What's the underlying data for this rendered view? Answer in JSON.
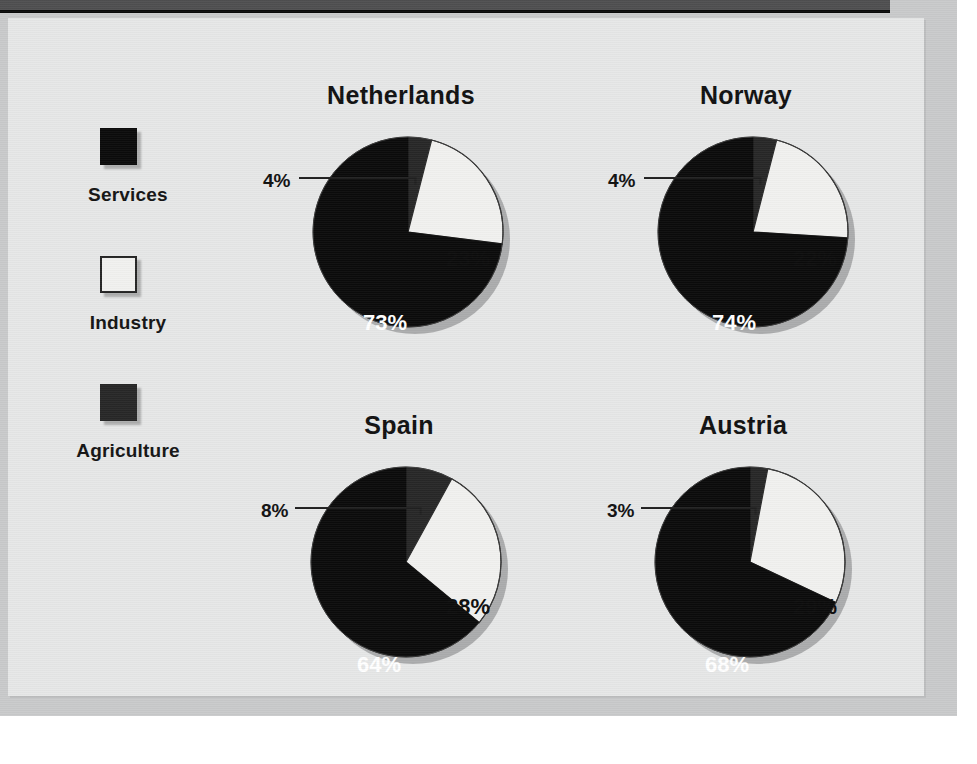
{
  "titlebar": {
    "text": ""
  },
  "legend": {
    "items": [
      {
        "label": "Services",
        "color": "#0b0b0b",
        "swatch": "filled-black-square"
      },
      {
        "label": "Industry",
        "color": "#f1f1ef",
        "swatch": "outlined-white-square"
      },
      {
        "label": "Agriculture",
        "color": "#272727",
        "swatch": "filled-darkgray-square"
      }
    ]
  },
  "colors": {
    "services": "#0b0b0b",
    "industry": "#f1f1ef",
    "agriculture": "#272727",
    "panel_background": "#e6e7e7",
    "frame": "#c9cacb",
    "titlebar": "#4f4f50"
  },
  "chart_data": [
    {
      "type": "pie",
      "title": "Netherlands",
      "labels": [
        "Agriculture",
        "Industry",
        "Services"
      ],
      "values": [
        4,
        23,
        73
      ],
      "value_labels": [
        "4%",
        "23%",
        "73%"
      ],
      "colors": [
        "#272727",
        "#f1f1ef",
        "#0b0b0b"
      ],
      "leader_label": "4%",
      "legend_position": "left",
      "grid": false
    },
    {
      "type": "pie",
      "title": "Norway",
      "labels": [
        "Agriculture",
        "Industry",
        "Services"
      ],
      "values": [
        4,
        22,
        74
      ],
      "value_labels": [
        "4%",
        "22%",
        "74%"
      ],
      "colors": [
        "#272727",
        "#f1f1ef",
        "#0b0b0b"
      ],
      "leader_label": "4%",
      "legend_position": "left",
      "grid": false
    },
    {
      "type": "pie",
      "title": "Spain",
      "labels": [
        "Agriculture",
        "Industry",
        "Services"
      ],
      "values": [
        8,
        28,
        64
      ],
      "value_labels": [
        "8%",
        "28%",
        "64%"
      ],
      "colors": [
        "#272727",
        "#f1f1ef",
        "#0b0b0b"
      ],
      "leader_label": "8%",
      "legend_position": "left",
      "grid": false
    },
    {
      "type": "pie",
      "title": "Austria",
      "labels": [
        "Agriculture",
        "Industry",
        "Services"
      ],
      "values": [
        3,
        29,
        68
      ],
      "value_labels": [
        "3%",
        "29%",
        "68%"
      ],
      "colors": [
        "#272727",
        "#f1f1ef",
        "#0b0b0b"
      ],
      "leader_label": "3%",
      "legend_position": "left",
      "grid": false
    }
  ]
}
